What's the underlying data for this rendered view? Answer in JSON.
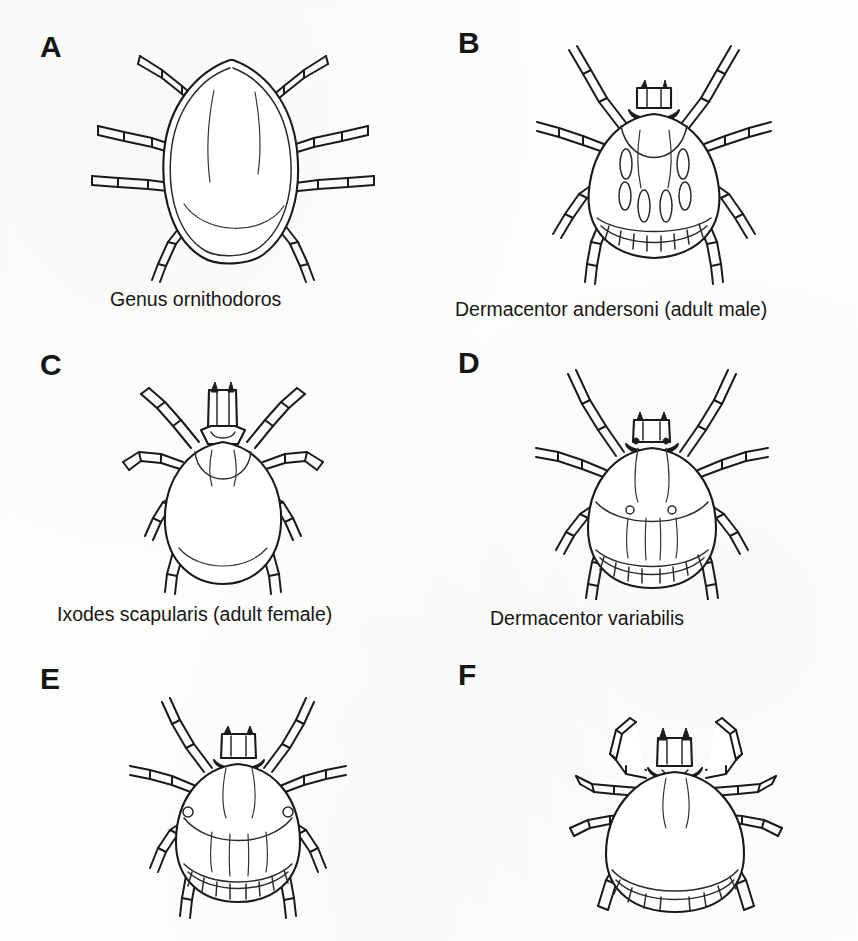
{
  "figure": {
    "background_color": "#fdfdfb",
    "ink_color": "#1a1a1a",
    "layout": "2 columns x 3 rows",
    "panels": [
      {
        "id": "A",
        "letter": "A",
        "caption": "Genus ornithodoros",
        "organism": "soft tick (Argasidae), dorsal view",
        "features": "rounded leathery body, capitulum not visible from above, eight legs"
      },
      {
        "id": "B",
        "letter": "B",
        "caption": "Dermacentor andersoni (adult male)",
        "organism": "hard tick (Ixodidae), dorsal view",
        "features": "ornate scutum covering entire dorsum, festoons along posterior margin, eight legs"
      },
      {
        "id": "C",
        "letter": "C",
        "caption": "Ixodes scapularis (adult female)",
        "organism": "hard tick (Ixodidae), dorsal view",
        "features": "long capitulum, small inornate scutum, no festoons, eight legs"
      },
      {
        "id": "D",
        "letter": "D",
        "caption": "Dermacentor variabilis",
        "organism": "hard tick (Ixodidae), dorsal view",
        "features": "large scutum with eyes, festoons along posterior margin, eight legs"
      },
      {
        "id": "E",
        "letter": "E",
        "caption": "",
        "caption_note": "caption cropped off bottom edge of image",
        "organism": "hard tick (Ixodidae), dorsal view",
        "features": "scutum with lateral eyes, festoons, eight legs"
      },
      {
        "id": "F",
        "letter": "F",
        "caption": "",
        "caption_note": "caption cropped off bottom edge of image",
        "organism": "hard tick (Ixodidae), dorsal view",
        "features": "elongate oval body, long capitulum, festoons, eight long legs"
      }
    ]
  }
}
